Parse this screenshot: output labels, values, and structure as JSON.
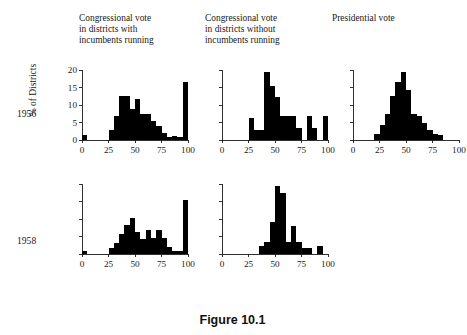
{
  "figure": {
    "caption": "Figure 10.1",
    "y_axis_title": "% of Districts",
    "row_labels": [
      "1956",
      "1958"
    ],
    "column_titles": [
      "Congressional vote\nin districts with\nincumbents running",
      "Congressional vote\nin districts without\nincumbents running",
      "Presidential vote"
    ]
  },
  "chart_data": [
    {
      "type": "bar",
      "id": "panel-1956-with-incumbents",
      "title": "Congressional vote in districts with incumbents running",
      "row": "1956",
      "xlabel": "",
      "ylabel": "% of Districts",
      "xlim": [
        0,
        100
      ],
      "ylim": [
        0,
        20
      ],
      "xticks": [
        0,
        25,
        50,
        75,
        100
      ],
      "xticklabels": [
        "0",
        "25",
        "50",
        "75",
        "100"
      ],
      "yticks": [
        0,
        5,
        10,
        15,
        20
      ],
      "yticklabels": [
        "0",
        "5",
        "10",
        "15",
        "20"
      ],
      "show_ytick_labels": true,
      "grid": false,
      "bin_width": 5,
      "bin_starts": [
        0,
        5,
        10,
        15,
        20,
        25,
        30,
        35,
        40,
        45,
        50,
        55,
        60,
        65,
        70,
        75,
        80,
        85,
        90,
        95
      ],
      "values": [
        1.5,
        0,
        0,
        0,
        0,
        3.0,
        6.8,
        12.5,
        12.5,
        9.0,
        11.6,
        7.3,
        7.3,
        5.3,
        4.1,
        2.1,
        1.0,
        1.2,
        1.0,
        16.5
      ]
    },
    {
      "type": "bar",
      "id": "panel-1956-without-incumbents",
      "title": "Congressional vote in districts without incumbents running",
      "row": "1956",
      "xlabel": "",
      "ylabel": "",
      "xlim": [
        0,
        100
      ],
      "ylim": [
        0,
        20
      ],
      "xticks": [
        0,
        25,
        50,
        75,
        100
      ],
      "xticklabels": [
        "0",
        "25",
        "50",
        "75",
        "100"
      ],
      "yticks": [
        0,
        5,
        10,
        15,
        20
      ],
      "yticklabels": [
        "",
        "",
        "",
        "",
        ""
      ],
      "show_ytick_labels": false,
      "grid": false,
      "bin_width": 5,
      "bin_starts": [
        0,
        5,
        10,
        15,
        20,
        25,
        30,
        35,
        40,
        45,
        50,
        55,
        60,
        65,
        70,
        75,
        80,
        85,
        90,
        95
      ],
      "values": [
        0,
        0,
        0,
        0,
        0,
        6.3,
        2.8,
        2.8,
        19.4,
        15.3,
        12.3,
        6.9,
        6.9,
        6.9,
        3.4,
        0,
        6.9,
        3.4,
        0,
        6.9
      ]
    },
    {
      "type": "bar",
      "id": "panel-1956-presidential",
      "title": "Presidential vote",
      "row": "1956",
      "xlabel": "",
      "ylabel": "",
      "xlim": [
        0,
        100
      ],
      "ylim": [
        0,
        20
      ],
      "xticks": [
        0,
        25,
        50,
        75,
        100
      ],
      "xticklabels": [
        "0",
        "25",
        "50",
        "75",
        "100"
      ],
      "yticks": [
        0,
        5,
        10,
        15,
        20
      ],
      "yticklabels": [
        "",
        "",
        "",
        "",
        ""
      ],
      "show_ytick_labels": false,
      "grid": false,
      "bin_width": 5,
      "bin_starts": [
        0,
        5,
        10,
        15,
        20,
        25,
        30,
        35,
        40,
        45,
        50,
        55,
        60,
        65,
        70,
        75,
        80,
        85,
        90,
        95
      ],
      "values": [
        0,
        0,
        0,
        0,
        1.6,
        4.4,
        7.3,
        12.6,
        16.5,
        19.4,
        14.3,
        7.3,
        7.0,
        5.0,
        3.0,
        1.6,
        1.3,
        0,
        0,
        0
      ]
    },
    {
      "type": "bar",
      "id": "panel-1958-with-incumbents",
      "title": "Congressional vote in districts with incumbents running",
      "row": "1958",
      "xlabel": "",
      "ylabel": "",
      "xlim": [
        0,
        100
      ],
      "ylim": [
        0,
        20
      ],
      "xticks": [
        0,
        25,
        50,
        75,
        100
      ],
      "xticklabels": [
        "0",
        "25",
        "50",
        "75",
        "100"
      ],
      "yticks": [
        0,
        5,
        10,
        15,
        20
      ],
      "yticklabels": [
        "",
        "",
        "",
        "",
        ""
      ],
      "show_ytick_labels": false,
      "grid": false,
      "bin_width": 5,
      "bin_starts": [
        0,
        5,
        10,
        15,
        20,
        25,
        30,
        35,
        40,
        45,
        50,
        55,
        60,
        65,
        70,
        75,
        80,
        85,
        90,
        95
      ],
      "values": [
        1.0,
        0,
        0,
        0,
        0,
        1.6,
        3.1,
        5.7,
        8.3,
        10.4,
        6.2,
        4.2,
        7.0,
        4.7,
        7.0,
        4.7,
        2.1,
        1.0,
        1.0,
        15.4
      ]
    },
    {
      "type": "bar",
      "id": "panel-1958-without-incumbents",
      "title": "Congressional vote in districts without incumbents running",
      "row": "1958",
      "xlabel": "",
      "ylabel": "",
      "xlim": [
        0,
        100
      ],
      "ylim": [
        0,
        20
      ],
      "xticks": [
        0,
        25,
        50,
        75,
        100
      ],
      "xticklabels": [
        "0",
        "25",
        "50",
        "75",
        "100"
      ],
      "yticks": [
        0,
        5,
        10,
        15,
        20
      ],
      "yticklabels": [
        "",
        "",
        "",
        "",
        ""
      ],
      "show_ytick_labels": false,
      "grid": false,
      "bin_width": 5,
      "bin_starts": [
        0,
        5,
        10,
        15,
        20,
        25,
        30,
        35,
        40,
        45,
        50,
        55,
        60,
        65,
        70,
        75,
        80,
        85,
        90,
        95
      ],
      "values": [
        0,
        0,
        0,
        0,
        0,
        0,
        0,
        2.3,
        3.4,
        9.1,
        19.4,
        17.4,
        3.4,
        8.0,
        3.4,
        1.7,
        1.7,
        0,
        2.3,
        0
      ]
    }
  ]
}
